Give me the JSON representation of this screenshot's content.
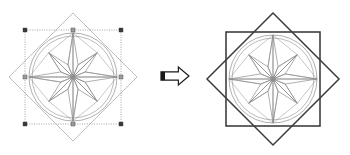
{
  "canvas": {
    "width": 350,
    "height": 155,
    "background": "#ffffff",
    "description": "Vector drawing editor illustration: a compass-rose shape before and after a square is added"
  },
  "colors": {
    "rose_stroke": "#8c8c8c",
    "circle_stroke": "#8a8a8a",
    "diamond_light": "#b5b5b5",
    "diamond_dark": "#3c3c3c",
    "square_dark": "#333333",
    "selection_line": "#9a9a9a",
    "handle_fill": "#3a3a3a",
    "arrow_fill": "#ffffff",
    "arrow_stroke": "#1a1a1a",
    "arrow_tab": "#1a1a1a"
  },
  "left_figure": {
    "label": "original-selection",
    "center": {
      "x": 73,
      "y": 77
    },
    "rose_radius": 44,
    "diamond_radius": 64,
    "selection_box": {
      "x": 25,
      "y": 30,
      "width": 96,
      "height": 94,
      "style": "dotted",
      "handle_size": 4,
      "handle_count": 8
    }
  },
  "arrow": {
    "label": "transform-arrow",
    "direction": "right",
    "x": 161,
    "y": 67,
    "width": 28,
    "height": 18,
    "tab_width": 4
  },
  "right_figure": {
    "label": "result-with-square",
    "center": {
      "x": 273,
      "y": 79
    },
    "rose_radius": 44,
    "diamond_radius": 66,
    "square": {
      "x": 226,
      "y": 32,
      "width": 94,
      "height": 94
    }
  },
  "compass_rose": {
    "points": 8,
    "long_point_ratio": 1.0,
    "short_point_ratio": 0.78,
    "inner_radius_ratio": 0.3,
    "hub_radius_ratio": 0.055,
    "outer_circle": true,
    "inner_circle_ratio": 0.93
  }
}
